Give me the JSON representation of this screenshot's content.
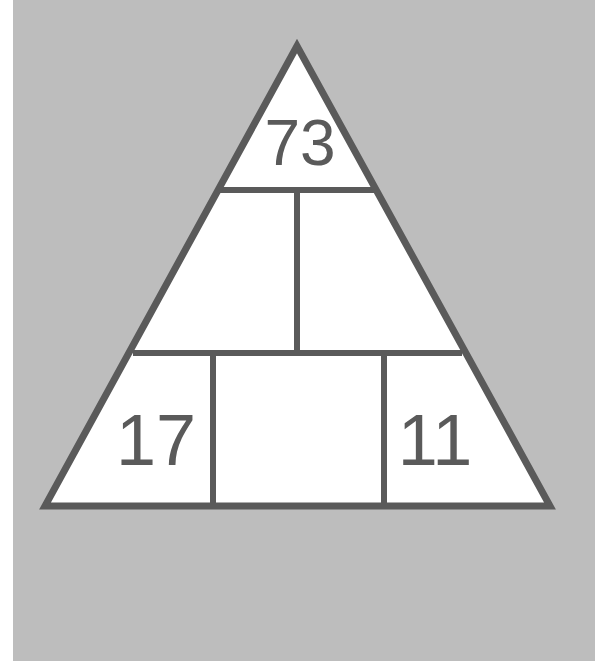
{
  "puzzle": {
    "type": "number-pyramid",
    "colors": {
      "background": "#bdbdbd",
      "cell_fill": "#ffffff",
      "stroke": "#5a5a5a",
      "text": "#5a5a5a"
    },
    "rows": [
      {
        "row": 1,
        "cells": [
          {
            "value": "73"
          }
        ]
      },
      {
        "row": 2,
        "cells": [
          {
            "value": ""
          },
          {
            "value": ""
          }
        ]
      },
      {
        "row": 3,
        "cells": [
          {
            "value": "17"
          },
          {
            "value": ""
          },
          {
            "value": "11"
          }
        ]
      }
    ],
    "top": "73",
    "middle_left": "",
    "middle_right": "",
    "bottom_left": "17",
    "bottom_center": "",
    "bottom_right": "11"
  }
}
